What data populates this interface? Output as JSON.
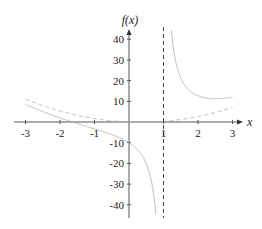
{
  "chart_data": {
    "type": "line",
    "title": "",
    "xlabel": "x",
    "ylabel": "f(x)",
    "xlim": [
      -3,
      3
    ],
    "ylim": [
      -45,
      45
    ],
    "grid": false,
    "x_ticks": [
      -3,
      -2,
      -1,
      1,
      2,
      3
    ],
    "x_tick_labels": [
      "-3",
      "-2",
      "-1",
      "1",
      "2",
      "3"
    ],
    "y_ticks": [
      40,
      30,
      20,
      10,
      -10,
      -20,
      -30,
      -40
    ],
    "y_tick_labels": [
      "40",
      "30",
      "20",
      "10",
      "-10",
      "-20",
      "-30",
      "-40"
    ],
    "series": [
      {
        "name": "f(x)",
        "style": "solid",
        "color": "#b8b8b8",
        "formula": "x^2 - (2/3)x + 10/(x-1)",
        "x": [
          -3,
          -2,
          -1.6,
          -1,
          -0.5,
          0,
          0.5,
          0.8,
          1.2,
          1.5,
          2,
          2.5,
          3
        ],
        "y": [
          8.5,
          1.33,
          -0.2,
          -3.33,
          -6.08,
          -10,
          -20.08,
          -49.89,
          50.64,
          21.25,
          12.67,
          11.25,
          12
        ]
      },
      {
        "name": "asymptote-curve",
        "style": "dashed",
        "color": "#b8b8b8",
        "formula": "x^2 - (2/3)x",
        "x": [
          -3,
          -2,
          -1,
          0,
          0.33,
          1,
          2,
          3
        ],
        "y": [
          11,
          5.33,
          1.67,
          0,
          -0.11,
          0.33,
          2.67,
          7
        ]
      },
      {
        "name": "vertical-asymptote",
        "style": "dashed",
        "color": "#444444",
        "x": [
          1,
          1
        ],
        "y": [
          -45,
          45
        ]
      }
    ]
  },
  "axes": {
    "x_label": "x",
    "y_label": "f(x)"
  }
}
